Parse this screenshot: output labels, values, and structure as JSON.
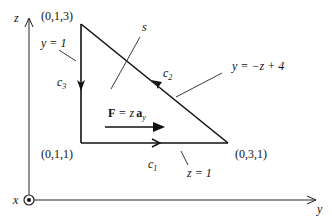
{
  "axes": {
    "z_label": "z",
    "y_label": "y",
    "x_label": "x",
    "x_axis_symbol": "circle-dot (out of page)"
  },
  "vertices": {
    "top": "(0,1,3)",
    "bottom_left": "(0,1,1)",
    "bottom_right": "(0,3,1)"
  },
  "contours": {
    "c1": "c",
    "c1_sub": "1",
    "c2": "c",
    "c2_sub": "2",
    "c3": "c",
    "c3_sub": "3"
  },
  "surface_label": "s",
  "equations": {
    "left_edge": "y = 1",
    "hypotenuse": "y = −z + 4",
    "bottom_edge": "z = 1"
  },
  "field": {
    "bold_F": "F",
    "equals": " = z",
    "bold_a": "a",
    "sub": "y"
  },
  "colors": {
    "stroke": "#111111",
    "background": "#ffffff"
  }
}
